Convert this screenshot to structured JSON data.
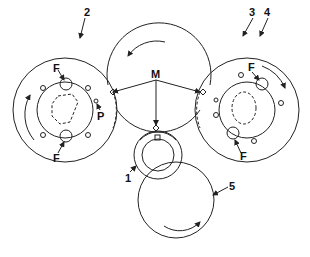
{
  "diagram": {
    "type": "roller/cylinder arrangement",
    "labels": {
      "cyl1": "1",
      "cyl2": "2",
      "cyl3": "3",
      "cyl4": "4",
      "cyl5": "5",
      "m": "M",
      "p": "P",
      "f": "F"
    },
    "colors": {
      "line": "#222222",
      "background": "#ffffff"
    }
  }
}
